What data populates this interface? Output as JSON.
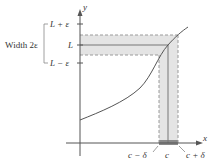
{
  "figure": {
    "axes": {
      "x_label": "x",
      "y_label": "y"
    },
    "y_ticks": {
      "upper": "L + ε",
      "middle": "L",
      "lower": "L − ε"
    },
    "x_ticks": {
      "left": "c − δ",
      "middle": "c",
      "right": "c + δ"
    },
    "bracket_label": "Width 2ε",
    "colors": {
      "band_fill": "#e4e4e4",
      "band_overlap": "#b8b8b8",
      "dashed": "#9a9a9a",
      "axis": "#555555",
      "curve": "#555555",
      "text": "#333333"
    }
  }
}
